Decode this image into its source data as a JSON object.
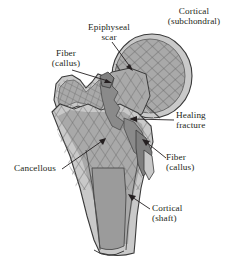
{
  "figure": {
    "background": "#ffffff",
    "ink": "#241f20",
    "palette": {
      "cortical_rim": "#c9c9c9",
      "cancellous_fill": "#a9a9a9",
      "medullary_cavity": "#9b9b9b",
      "fracture_dark": "#8a8a8a",
      "callus_dark": "#7f7f7f",
      "trabecula_line": "#6f6f6f",
      "outline": "#3a3a3a"
    }
  },
  "labels": [
    {
      "id": "cortical-subchondral",
      "text": "Cortical\n(subchondral)",
      "x": 152,
      "y": 6,
      "w": 84,
      "leader": false
    },
    {
      "id": "epiphyseal-scar",
      "text": "Epiphyseal\nscar",
      "x": 78,
      "y": 22,
      "w": 62,
      "leader": true
    },
    {
      "id": "fiber-callus-left",
      "text": "Fiber\n(callus)",
      "x": 44,
      "y": 48,
      "w": 44,
      "leader": true
    },
    {
      "id": "healing-fracture",
      "text": "Healing\nfracture",
      "x": 176,
      "y": 110,
      "w": 60,
      "leader": true
    },
    {
      "id": "fiber-callus-right",
      "text": "Fiber\n(callus)",
      "x": 166,
      "y": 152,
      "w": 48,
      "leader": true
    },
    {
      "id": "cancellous",
      "text": "Cancellous",
      "x": 4,
      "y": 163,
      "w": 62,
      "leader": true
    },
    {
      "id": "cortical-shaft",
      "text": "Cortical\n(shaft)",
      "x": 152,
      "y": 203,
      "w": 52,
      "leader": true
    }
  ],
  "leaders": [
    {
      "id": "leader-epiphyseal-scar",
      "from": [
        112,
        42
      ],
      "to": [
        133,
        70
      ]
    },
    {
      "id": "leader-fiber-callus-left",
      "from": [
        72,
        70
      ],
      "to": [
        111,
        83
      ]
    },
    {
      "id": "leader-healing-fracture",
      "from": [
        174,
        121
      ],
      "to": [
        130,
        119
      ]
    },
    {
      "id": "leader-fiber-callus-right",
      "from": [
        166,
        158
      ],
      "to": [
        143,
        140
      ]
    },
    {
      "id": "leader-cancellous",
      "from": [
        62,
        169
      ],
      "to": [
        105,
        139
      ]
    },
    {
      "id": "leader-cortical-shaft",
      "from": [
        150,
        209
      ],
      "to": [
        129,
        196
      ]
    }
  ]
}
